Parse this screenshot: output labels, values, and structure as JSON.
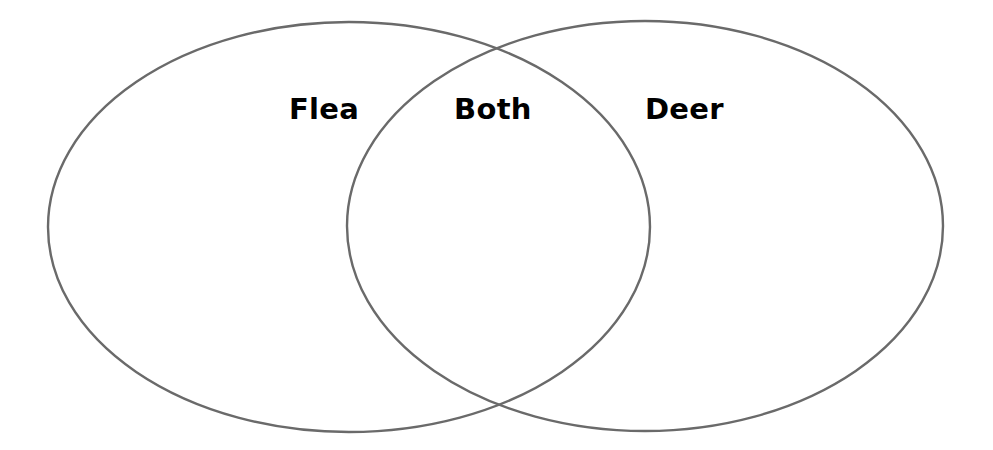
{
  "diagram": {
    "type": "venn",
    "stroke_color": "#6a6a6a",
    "background": "#ffffff",
    "sets": [
      {
        "id": "left",
        "label": "Flea",
        "shape": "ellipse",
        "cx": 349,
        "cy": 227,
        "rx": 301,
        "ry": 205
      },
      {
        "id": "right",
        "label": "Deer",
        "shape": "ellipse",
        "cx": 645,
        "cy": 226,
        "rx": 298,
        "ry": 205
      }
    ],
    "labels": {
      "left": "Flea",
      "center": "Both",
      "right": "Deer"
    }
  }
}
